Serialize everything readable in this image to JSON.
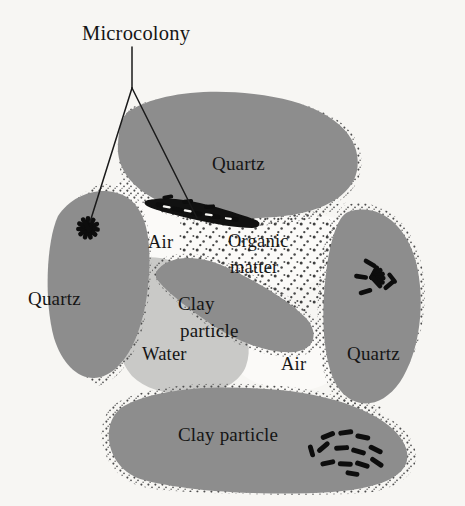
{
  "figure": {
    "width": 465,
    "height": 506,
    "background_color": "#f7f6f3"
  },
  "callout": {
    "label": "Microcolony",
    "leader_color": "#1a1a1a"
  },
  "labels": {
    "quartz_top": "Quartz",
    "quartz_left": "Quartz",
    "quartz_right": "Quartz",
    "clay_center_line1": "Clay",
    "clay_center_line2": "particle",
    "clay_bottom": "Clay particle",
    "air_upper": "Air",
    "air_lower": "Air",
    "organic_line1": "Organic",
    "organic_line2": "matter",
    "water": "Water"
  },
  "colors": {
    "grain_fill": "#8d8d8d",
    "clay_fill": "#8d8d8d",
    "water_fill": "#c9c9c7",
    "air_fill": "#fbfaf8",
    "bacteria": "#0d0d0d",
    "stipple": "#4a4a4a",
    "text": "#151515"
  },
  "components": [
    {
      "name": "quartz-grain-top",
      "kind": "mineral-grain",
      "material": "Quartz"
    },
    {
      "name": "quartz-grain-left",
      "kind": "mineral-grain",
      "material": "Quartz"
    },
    {
      "name": "quartz-grain-right",
      "kind": "mineral-grain",
      "material": "Quartz"
    },
    {
      "name": "clay-particle-center",
      "kind": "clay-particle",
      "material": "Clay particle"
    },
    {
      "name": "clay-particle-bottom",
      "kind": "clay-particle",
      "material": "Clay particle"
    },
    {
      "name": "water-film",
      "kind": "pore-fluid",
      "material": "Water"
    },
    {
      "name": "air-pore-upper",
      "kind": "pore-space",
      "material": "Air"
    },
    {
      "name": "air-pore-lower",
      "kind": "pore-space",
      "material": "Air"
    },
    {
      "name": "organic-matter-region",
      "kind": "organic",
      "material": "Organic matter"
    }
  ],
  "microcolonies": [
    {
      "name": "microcolony-left-quartz",
      "arrangement": "radial-starburst",
      "rod_count": 11
    },
    {
      "name": "microcolony-pore-band",
      "arrangement": "dense-band",
      "rod_count": 14
    },
    {
      "name": "microcolony-right-quartz",
      "arrangement": "fan",
      "rod_count": 11
    },
    {
      "name": "microcolony-bottom-clay",
      "arrangement": "cluster",
      "rod_count": 13
    }
  ]
}
